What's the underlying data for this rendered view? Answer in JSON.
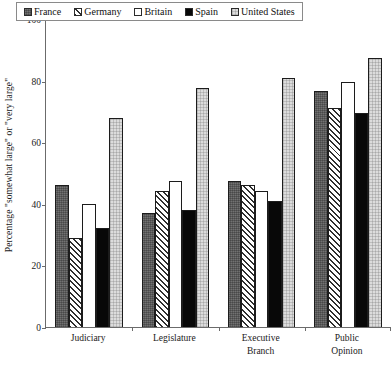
{
  "chart_data": {
    "type": "bar",
    "title": "",
    "xlabel": "",
    "ylabel": "Percentage \"somewhat large\" or \"very large\"",
    "ylim": [
      0,
      100
    ],
    "yticks": [
      0,
      20,
      40,
      60,
      80,
      100
    ],
    "grid": false,
    "legend_position": "top",
    "categories": [
      "Judiciary",
      "Legislature",
      "Executive Branch",
      "Public Opinion"
    ],
    "category_lines": [
      [
        "Judiciary"
      ],
      [
        "Legislature"
      ],
      [
        "Executive",
        "Branch"
      ],
      [
        "Public",
        "Opinion"
      ]
    ],
    "series": [
      {
        "name": "France",
        "fill": "solid-dark-gray",
        "color": "#5d5d5d",
        "values": [
          46,
          37,
          47.5,
          76.5
        ]
      },
      {
        "name": "Germany",
        "fill": "diagonal-hatch",
        "color": "#2f2f2f",
        "values": [
          29,
          44,
          46,
          71
        ]
      },
      {
        "name": "Britain",
        "fill": "white-outline",
        "color": "#ffffff",
        "values": [
          40,
          47.5,
          44,
          79.5
        ]
      },
      {
        "name": "Spain",
        "fill": "solid-black",
        "color": "#080808",
        "values": [
          32,
          38,
          41,
          69.5
        ]
      },
      {
        "name": "United States",
        "fill": "light-gray-stipple",
        "color": "#dcdcdc",
        "values": [
          68,
          77.5,
          81,
          87.5
        ]
      }
    ]
  },
  "legend": {
    "entries": [
      {
        "label": "France"
      },
      {
        "label": "Germany"
      },
      {
        "label": "Britain"
      },
      {
        "label": "Spain"
      },
      {
        "label": "United States"
      }
    ]
  }
}
